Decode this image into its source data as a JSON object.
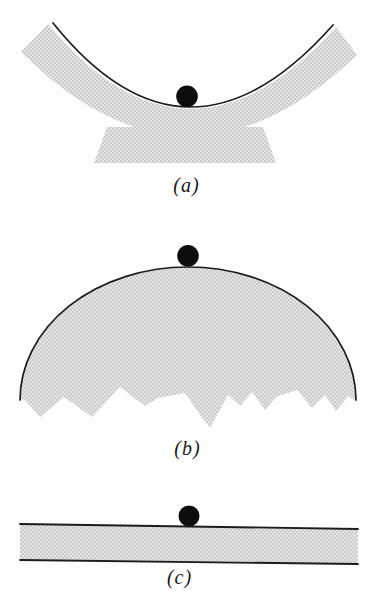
{
  "figure": {
    "panels": [
      {
        "label": "(a)"
      },
      {
        "label": "(b)"
      },
      {
        "label": "(c)"
      }
    ],
    "colors": {
      "surface_fill_light": "#e4e4e4",
      "surface_fill_dark": "#cccccc",
      "outline": "#1c1c1c",
      "ball": "#0d0d0d",
      "background": "#fefefe",
      "label_text": "#1a1a1a"
    }
  }
}
